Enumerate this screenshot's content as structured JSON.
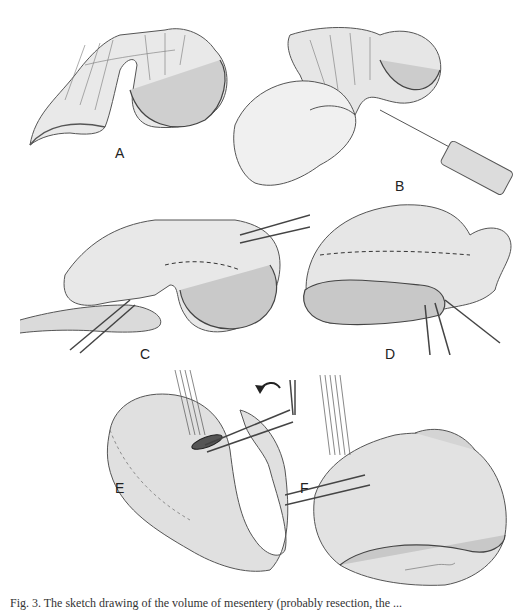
{
  "figure": {
    "panels": [
      {
        "id": "A",
        "label": "A",
        "description": "Segment of small bowel loop with mesentery and vascular arcades"
      },
      {
        "id": "B",
        "label": "B",
        "description": "Hand holding bowel loop while a needle/syringe injects into mesentery"
      },
      {
        "id": "C",
        "label": "C",
        "description": "Clamps applied to bowel and mesentery with dashed resection line"
      },
      {
        "id": "D",
        "label": "D",
        "description": "Bowel with mesentery, dashed line and clamps at resection site"
      },
      {
        "id": "E",
        "label": "E",
        "description": "Bowel loop folded with sutures and clamp, curved arrow indicating rotation"
      },
      {
        "id": "F",
        "label": "F",
        "description": "Anastomosis with multiple sutures and clamps on bowel loops"
      }
    ],
    "caption": "Fig. 3. The sketch drawing of the volume of mesentery (probably resection, the ...",
    "colors": {
      "ink": "#333333",
      "shade": "#8a8a8a",
      "paper": "#ffffff"
    }
  }
}
